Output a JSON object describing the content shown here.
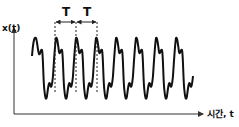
{
  "diagram": {
    "y_axis_label": "x(t)",
    "x_axis_label": "시간, t",
    "period_labels": [
      "T",
      "T"
    ],
    "colors": {
      "signal": "#111111",
      "axis": "#333333",
      "background": "#ffffff"
    }
  }
}
